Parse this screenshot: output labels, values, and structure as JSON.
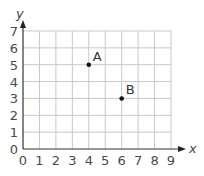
{
  "chart_data": {
    "type": "scatter",
    "title": "",
    "xlabel": "x",
    "ylabel": "y",
    "xlim": [
      0,
      9
    ],
    "ylim": [
      0,
      7
    ],
    "grid": true,
    "x_ticks": [
      "0",
      "1",
      "2",
      "3",
      "4",
      "5",
      "6",
      "7",
      "8",
      "9"
    ],
    "y_ticks": [
      "0",
      "1",
      "2",
      "3",
      "4",
      "5",
      "6",
      "7"
    ],
    "points": [
      {
        "label": "A",
        "x": 4,
        "y": 5
      },
      {
        "label": "B",
        "x": 6,
        "y": 3
      }
    ]
  },
  "colors": {
    "grid": "#c8c8c8",
    "axis": "#333333",
    "point": "#111111"
  }
}
